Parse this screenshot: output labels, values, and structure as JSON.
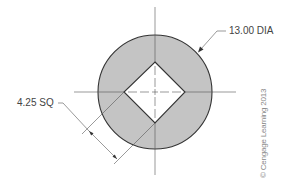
{
  "drawing": {
    "title": "Circular part with square hole",
    "colors": {
      "fill": "#c4c4c4",
      "outline": "#333333",
      "centerline": "#555555",
      "dimension": "#555555",
      "hole": "#ffffff"
    },
    "circle": {
      "cx": 155,
      "cy": 92,
      "r": 57
    },
    "square_hole": {
      "top": [
        155,
        62
      ],
      "right": [
        185,
        92
      ],
      "bottom": [
        155,
        123
      ],
      "left": [
        124,
        92
      ]
    }
  },
  "annotations": {
    "diameter_label": "13.00 DIA",
    "square_label": "4.25 SQ",
    "copyright": "© Cengage Learning 2013"
  }
}
